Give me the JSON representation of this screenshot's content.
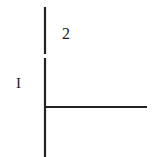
{
  "figure": {
    "background_color": "#ffffff",
    "stroke_color": "#222222",
    "width": 160,
    "height": 157,
    "labels": {
      "vertical_lower_label": "I",
      "vertical_upper_label": "2"
    },
    "strokes": [
      {
        "name": "vertical-line-upper-segment",
        "orientation": "vertical",
        "x1": 45,
        "y1": 7,
        "x2": 45,
        "y2": 54,
        "width": 2
      },
      {
        "name": "vertical-line-lower-segment",
        "orientation": "vertical",
        "x1": 45,
        "y1": 58,
        "x2": 45,
        "y2": 157,
        "width": 2
      },
      {
        "name": "horizontal-line",
        "orientation": "horizontal",
        "x1": 45,
        "y1": 107,
        "x2": 147,
        "y2": 107,
        "width": 2
      }
    ]
  }
}
